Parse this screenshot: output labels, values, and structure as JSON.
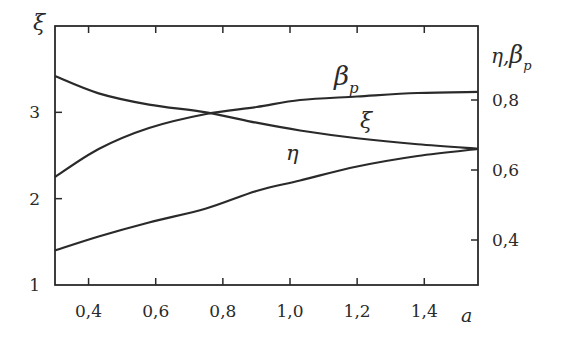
{
  "chart_data": {
    "type": "line",
    "title": "",
    "xlabel": "a",
    "ylabel_left": "ξ",
    "ylabel_right": "η, β_p",
    "xlim": [
      0.3,
      1.56
    ],
    "ylim_left": [
      1,
      4
    ],
    "ylim_right": [
      0.26,
      0.86
    ],
    "x_ticks": [
      "0,4",
      "0,6",
      "0,8",
      "1,0",
      "1,2",
      "1,4"
    ],
    "x_tick_values": [
      0.4,
      0.6,
      0.8,
      1.0,
      1.2,
      1.4
    ],
    "y_left_ticks": [
      "1",
      "2",
      "3"
    ],
    "y_left_tick_values": [
      1,
      2,
      3
    ],
    "y_right_ticks": [
      "0,4",
      "0,6",
      "0,8"
    ],
    "y_right_tick_values": [
      0.4,
      0.6,
      0.8
    ],
    "grid": false,
    "legend": "inline labels",
    "x": [
      0.3,
      0.43,
      0.58,
      0.75,
      0.9,
      1.03,
      1.2,
      1.38,
      1.56
    ],
    "series": [
      {
        "name": "ξ",
        "axis": "left",
        "label_text": "ξ",
        "values": [
          3.42,
          3.22,
          3.09,
          3.0,
          2.88,
          2.79,
          2.7,
          2.63,
          2.58
        ]
      },
      {
        "name": "β_p",
        "axis": "right",
        "label_text": "β",
        "label_sub": "p",
        "values": [
          0.58,
          0.66,
          0.72,
          0.76,
          0.78,
          0.8,
          0.81,
          0.82,
          0.823
        ]
      },
      {
        "name": "η",
        "axis": "right",
        "label_text": "η",
        "values": [
          0.37,
          0.41,
          0.45,
          0.49,
          0.54,
          0.57,
          0.61,
          0.64,
          0.66
        ]
      }
    ]
  }
}
